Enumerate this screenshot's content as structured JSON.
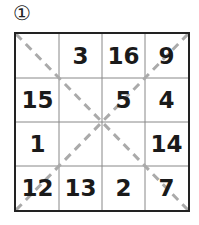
{
  "puzzle": {
    "label": "①",
    "grid": [
      [
        "",
        "3",
        "16",
        "9"
      ],
      [
        "15",
        "",
        "5",
        "4"
      ],
      [
        "1",
        "",
        "",
        "14"
      ],
      [
        "12",
        "13",
        "2",
        "7"
      ]
    ],
    "colors": {
      "border": "#222222",
      "gridline": "#888888",
      "diagonal": "#aaaaaa"
    }
  }
}
